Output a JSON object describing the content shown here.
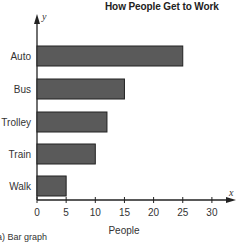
{
  "chart_data": {
    "type": "bar",
    "orientation": "horizontal",
    "title": "How People Get to Work",
    "categories": [
      "Auto",
      "Bus",
      "Trolley",
      "Train",
      "Walk"
    ],
    "values": [
      25,
      15,
      12,
      10,
      5
    ],
    "xlabel": "People",
    "ylabel": "",
    "x_axis_variable": "x",
    "y_axis_variable": "y",
    "xticks": [
      0,
      5,
      10,
      15,
      20,
      25,
      30
    ],
    "xlim": [
      0,
      32
    ],
    "grid": false,
    "legend": null,
    "bar_color": "#5a5a5a",
    "caption": "(a) Bar graph"
  },
  "labels": {
    "title": "How People Get to Work",
    "xlabel": "People",
    "x_var": "x",
    "y_var": "y",
    "caption": "(a) Bar graph",
    "categories": [
      "Auto",
      "Bus",
      "Trolley",
      "Train",
      "Walk"
    ],
    "ticks": [
      "0",
      "5",
      "10",
      "15",
      "20",
      "25",
      "30"
    ]
  }
}
